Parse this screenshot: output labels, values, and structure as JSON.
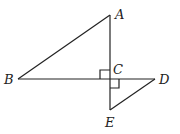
{
  "diagram": {
    "type": "geometry",
    "points": {
      "A": {
        "label": "A",
        "x": 110,
        "y": 15
      },
      "B": {
        "label": "B",
        "x": 18,
        "y": 79
      },
      "C": {
        "label": "C",
        "x": 110,
        "y": 79
      },
      "D": {
        "label": "D",
        "x": 155,
        "y": 79
      },
      "E": {
        "label": "E",
        "x": 110,
        "y": 110
      }
    },
    "segments": [
      "AB",
      "AE",
      "BD",
      "DE"
    ],
    "right_angles": [
      "ACB",
      "DCE"
    ],
    "line_color": "#222222"
  }
}
